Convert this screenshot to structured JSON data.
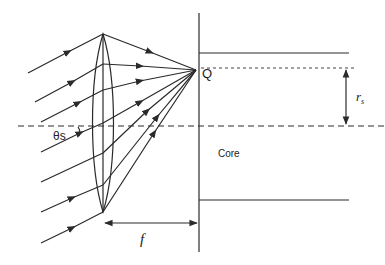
{
  "diagram": {
    "type": "optics",
    "colors": {
      "stroke": "#2a2a2a",
      "background": "#ffffff"
    },
    "labels": {
      "point": "Q",
      "angle": "θs",
      "radius": "r",
      "radius_sub": "s",
      "focal": "f",
      "region": "Core"
    },
    "elements": {
      "lens": {
        "cx": 103,
        "top": 34,
        "bottom": 212,
        "rx": 10
      },
      "focus_point": {
        "x": 196,
        "y": 70
      },
      "fiber_face_x": 199,
      "optical_axis_y": 126,
      "core_top_y": 53,
      "core_bottom_y": 200,
      "incident_rays": [
        {
          "from": [
            28,
            73
          ],
          "to": [
            103,
            34
          ]
        },
        {
          "from": [
            35,
            102
          ],
          "to": [
            103,
            64
          ]
        },
        {
          "from": [
            41,
            122
          ],
          "to": [
            103,
            90
          ]
        },
        {
          "from": [
            41,
            152
          ],
          "to": [
            103,
            123
          ]
        },
        {
          "from": [
            41,
            182
          ],
          "to": [
            103,
            153
          ]
        },
        {
          "from": [
            41,
            212
          ],
          "to": [
            103,
            185
          ]
        },
        {
          "from": [
            41,
            243
          ],
          "to": [
            103,
            212
          ]
        }
      ]
    }
  }
}
